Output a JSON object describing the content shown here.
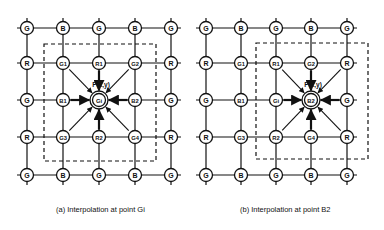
{
  "diagrams": [
    {
      "id": "a",
      "caption": "(a) Interpolation at point Gi",
      "cols": [
        27,
        63,
        99,
        135,
        171
      ],
      "rows": [
        28,
        63,
        100,
        137,
        175
      ],
      "grid": [
        [
          "G",
          "B",
          "G",
          "B",
          "G"
        ],
        [
          "R",
          "G1",
          "R1",
          "G2",
          "R"
        ],
        [
          "G",
          "B1",
          "Gi",
          "B2",
          "G"
        ],
        [
          "R",
          "G3",
          "R2",
          "G4",
          "R"
        ],
        [
          "G",
          "B",
          "G",
          "B",
          "G"
        ]
      ],
      "target": {
        "row": 2,
        "col": 2,
        "label": "Gi"
      },
      "point_label": "P(x,y)",
      "dashed_box": {
        "x1": 44,
        "y1": 44,
        "x2": 156,
        "y2": 161
      }
    },
    {
      "id": "b",
      "caption": "(b) Interpolation at point B2",
      "cols": [
        206,
        241,
        276,
        311,
        347
      ],
      "rows": [
        28,
        63,
        100,
        137,
        175
      ],
      "grid": [
        [
          "G",
          "B",
          "G",
          "B",
          "G"
        ],
        [
          "R",
          "G1",
          "R1",
          "G2",
          "R"
        ],
        [
          "G",
          "B1",
          "Gi",
          "B2",
          "G"
        ],
        [
          "R",
          "G3",
          "R2",
          "G4",
          "R"
        ],
        [
          "G",
          "B",
          "G",
          "B",
          "G"
        ]
      ],
      "target": {
        "row": 2,
        "col": 3,
        "label": "B2"
      },
      "point_label": "P(x,y)",
      "dashed_box": {
        "x1": 256,
        "y1": 43,
        "x2": 368,
        "y2": 159
      }
    }
  ]
}
